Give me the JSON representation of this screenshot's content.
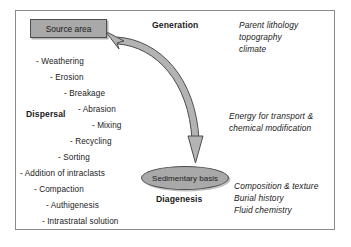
{
  "diagram": {
    "title_nodes": {
      "source_area": "Source area",
      "sedimentary_basin": "Sedimentary basis"
    },
    "stage_labels": {
      "generation": "Generation",
      "dispersal": "Dispersal",
      "diagenesis": "Diagenesis"
    },
    "process_list": [
      "- Weathering",
      "- Erosion",
      "- Breakage",
      "- Abrasion",
      "- Mixing",
      "- Recycling",
      "- Sorting",
      "- Addition of intraclasts",
      "- Compaction",
      "- Authigenesis",
      "- Intrastratal solution"
    ],
    "controls": {
      "generation": [
        "Parent lithology",
        "topography",
        "climate"
      ],
      "dispersal": [
        "Energy for transport &",
        "chemical modification"
      ],
      "diagenesis": [
        "Composition & texture",
        "Burial history",
        "Fluid chemistry"
      ]
    },
    "colors": {
      "node_fill": "#a9a9a9",
      "node_stroke": "#4d4d4d",
      "arrow_fill": "#b3b3b3",
      "arrow_stroke": "#4d4d4d",
      "frame_stroke": "#8a8a8a",
      "text": "#1a1a1a"
    }
  }
}
